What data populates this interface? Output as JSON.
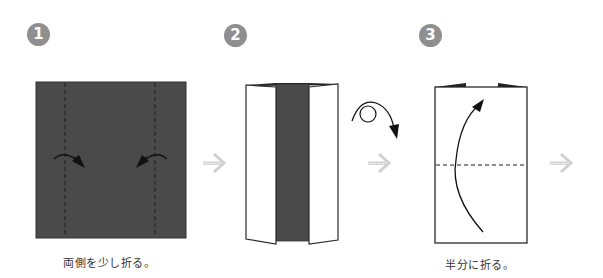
{
  "diagram": {
    "type": "origami-instructions",
    "colors": {
      "paper_colored": "#4a4a4a",
      "paper_white": "#ffffff",
      "outline": "#2a2a2a",
      "badge": "#8f8f8f",
      "step_arrow": "#d0d0d0"
    },
    "steps": [
      {
        "number": "1",
        "caption": "両側を少し折る。",
        "figure": "colored square with two vertical valley-fold dashed lines and two inward fold arrows"
      },
      {
        "number": "2",
        "caption": "",
        "figure": "both sides folded in showing white panels with dark center strip; turn-over symbol"
      },
      {
        "number": "3",
        "caption": "半分に折る。",
        "figure": "white rectangle with horizontal dashed fold line at middle and upward curved arrow"
      }
    ],
    "symbols": {
      "turn_over": "turn-over-icon",
      "next_step": "next-step-arrow-icon"
    }
  }
}
